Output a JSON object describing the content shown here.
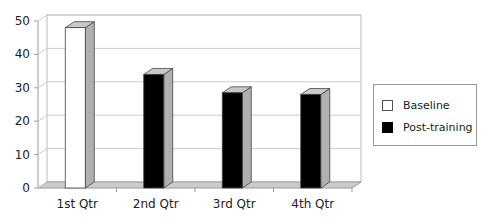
{
  "chart_data": {
    "type": "bar",
    "title": "",
    "xlabel": "",
    "ylabel": "",
    "categories": [
      "1st Qtr",
      "2nd Qtr",
      "3rd Qtr",
      "4th Qtr"
    ],
    "series": [
      {
        "name": "Baseline",
        "values": [
          48,
          null,
          null,
          null
        ],
        "color": "#ffffff"
      },
      {
        "name": "Post-training",
        "values": [
          null,
          34,
          28.5,
          28
        ],
        "color": "#000000"
      }
    ],
    "ylim": [
      0,
      50
    ],
    "yticks": [
      0,
      10,
      20,
      30,
      40,
      50
    ],
    "grid": true,
    "style": "3d-column",
    "legend_position": "right"
  },
  "legend": {
    "items": [
      {
        "label": "Baseline",
        "color": "#ffffff"
      },
      {
        "label": "Post-training",
        "color": "#000000"
      }
    ]
  }
}
